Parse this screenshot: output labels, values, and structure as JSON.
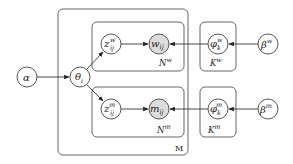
{
  "diagram": {
    "type": "plate-notation graphical model",
    "nodes": {
      "alpha": {
        "base": "α",
        "sup": "",
        "sub": "",
        "observed": false
      },
      "theta": {
        "base": "θ",
        "sup": "",
        "sub": "i",
        "observed": false
      },
      "z_w": {
        "base": "z",
        "sup": "w",
        "sub": "ij",
        "observed": false
      },
      "z_m": {
        "base": "z",
        "sup": "m",
        "sub": "ij",
        "observed": false
      },
      "w": {
        "base": "w",
        "sup": "",
        "sub": "ij",
        "observed": true
      },
      "m": {
        "base": "m",
        "sup": "",
        "sub": "ij",
        "observed": true
      },
      "phi_w": {
        "base": "φ",
        "sup": "w",
        "sub": "k",
        "observed": false
      },
      "phi_m": {
        "base": "φ",
        "sup": "m",
        "sub": "k",
        "observed": false
      },
      "beta_w": {
        "base": "β",
        "sup": "w",
        "sub": "",
        "observed": false
      },
      "beta_m": {
        "base": "β",
        "sup": "m",
        "sub": "",
        "observed": false
      }
    },
    "plates": {
      "M": {
        "label": "M"
      },
      "N_w": {
        "base": "N",
        "sup": "w"
      },
      "N_m": {
        "base": "N",
        "sup": "m"
      },
      "K_w": {
        "base": "K",
        "sup": "w"
      },
      "K_m": {
        "base": "K",
        "sup": "m"
      }
    },
    "edges": [
      [
        "alpha",
        "theta"
      ],
      [
        "theta",
        "z_w"
      ],
      [
        "theta",
        "z_m"
      ],
      [
        "z_w",
        "w"
      ],
      [
        "z_m",
        "m"
      ],
      [
        "phi_w",
        "w"
      ],
      [
        "phi_m",
        "m"
      ],
      [
        "beta_w",
        "phi_w"
      ],
      [
        "beta_m",
        "phi_m"
      ]
    ],
    "colors": {
      "observed_fill": "#dcdcdc",
      "stroke": "#444444"
    }
  }
}
